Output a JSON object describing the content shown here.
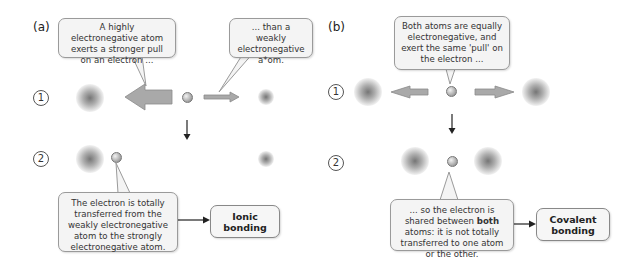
{
  "panel_a": {
    "label": "(a)",
    "step1": "1",
    "step2": "2",
    "bubble_strong": "A highly electronegative atom exerts a stronger pull on an electron ...",
    "bubble_weak": "... than a weakly electronegative a*om.",
    "bubble_transfer": "The electron is totally transferred from the weakly electronegative atom to the strongly electronegative atom.",
    "result": "Ionic bonding"
  },
  "panel_b": {
    "label": "(b)",
    "step1": "1",
    "step2": "2",
    "bubble_equal": "Both atoms are equally electronegative, and exert the same 'pull' on the electron ...",
    "bubble_shared_pre": "... so the electron is shared between ",
    "bubble_shared_bold": "both",
    "bubble_shared_post": " atoms: it is not totally transferred to one atom or the other.",
    "result": "Covalent bonding"
  },
  "colors": {
    "arrow_fill": "#a9a9a9",
    "arrow_stroke": "#8a8a8a",
    "bubble_fill": "#f4f4f4",
    "bubble_border": "#9a9a9a"
  }
}
